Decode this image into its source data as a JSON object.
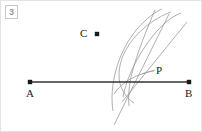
{
  "figure": {
    "badge": {
      "icon": "figure-number-badge",
      "text": "3"
    },
    "background_color": "#ffffff",
    "border_color": "#e3e3e3",
    "ink_color": "#333333",
    "construction_color": "#9a9a9a",
    "point_color": "#1a1a1a",
    "labels": {
      "a": "A",
      "b": "B",
      "c": "C",
      "p": "P"
    },
    "points": [
      {
        "name": "A",
        "x": 29,
        "y": 81
      },
      {
        "name": "B",
        "x": 188,
        "y": 81
      },
      {
        "name": "C",
        "x": 96,
        "y": 33
      },
      {
        "name": "P",
        "x": 130,
        "y": 81
      }
    ],
    "segment_ab": {
      "x1": 29,
      "y1": 81,
      "x2": 188,
      "y2": 81
    },
    "leader_line": {
      "x1": 140,
      "y1": 75,
      "x2": 155,
      "y2": 69
    }
  }
}
